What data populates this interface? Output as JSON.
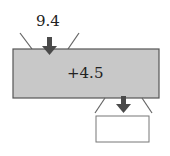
{
  "diagram": {
    "input_value": "9.4",
    "operation": "+4.5",
    "output_value": "",
    "colors": {
      "machine_fill": "#c8c8c8",
      "stroke": "#555555",
      "arrow": "#4a4a4a",
      "output_box": "#ffffff"
    }
  }
}
